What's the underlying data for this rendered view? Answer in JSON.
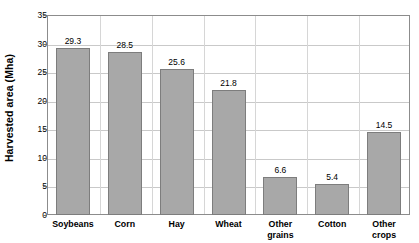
{
  "chart_data": {
    "type": "bar",
    "title": "",
    "xlabel": "",
    "ylabel": "Harvested area (Mha)",
    "categories": [
      "Soybeans",
      "Corn",
      "Hay",
      "Wheat",
      "Other grains",
      "Cotton",
      "Other crops"
    ],
    "values": [
      29.3,
      28.5,
      25.6,
      21.8,
      6.6,
      5.4,
      14.5
    ],
    "value_labels": [
      "29.3",
      "28.5",
      "25.6",
      "21.8",
      "6.6",
      "5.4",
      "14.5"
    ],
    "ylim": [
      0,
      35
    ],
    "ytick_values": [
      0,
      5,
      10,
      15,
      20,
      25,
      30,
      35
    ],
    "ytick_labels": [
      "0",
      "5",
      "10",
      "15",
      "20",
      "25",
      "30",
      "35"
    ],
    "grid": "horizontal",
    "legend": "none",
    "bar_color": "#a8a8a8",
    "bar_border_color": "#7d7d7d",
    "gridline_color": "#c9c9c9",
    "plot_border_color": "#8c8c8c",
    "background_color": "#ffffff"
  }
}
